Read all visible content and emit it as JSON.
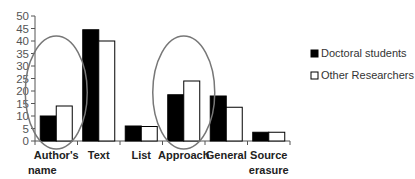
{
  "chart_data": {
    "type": "bar",
    "title": "",
    "xlabel": "",
    "ylabel": "",
    "ylim": [
      0,
      50
    ],
    "yticks": [
      0,
      5,
      10,
      15,
      20,
      25,
      30,
      35,
      40,
      45,
      50
    ],
    "categories": [
      [
        "Author's",
        "name"
      ],
      [
        "Text"
      ],
      [
        "List"
      ],
      [
        "Approach"
      ],
      [
        "General"
      ],
      [
        "Source",
        "erasure"
      ]
    ],
    "series": [
      {
        "name": "Doctoral students",
        "color": "#000000",
        "values": [
          10,
          44.5,
          6,
          18.5,
          18,
          3.5
        ]
      },
      {
        "name": "Other Researchers",
        "color": "#ffffff",
        "values": [
          14,
          40,
          5.8,
          24,
          13.5,
          3.5
        ]
      }
    ],
    "legend_position": "right",
    "grid": false,
    "highlighted_categories": [
      "Author's name",
      "Approach"
    ],
    "highlight_color": "#777777"
  }
}
